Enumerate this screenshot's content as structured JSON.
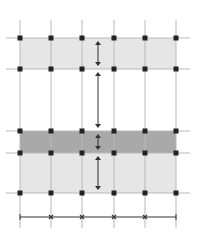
{
  "diagram": {
    "title": "",
    "colors": {
      "background": "#ffffff",
      "grid_line": "#b8b8b8",
      "light_band": "#e6e6e6",
      "dark_band": "#a9a9a9",
      "node": "#222222",
      "dimension": "#333333"
    },
    "columns": 6,
    "rows": 5,
    "bands": [
      {
        "name": "top-light-band",
        "shade": "light",
        "from_row": 0,
        "to_row": 1
      },
      {
        "name": "middle-dark-band",
        "shade": "dark",
        "from_row": 2,
        "to_row": 3
      },
      {
        "name": "bottom-light-band",
        "shade": "light",
        "from_row": 3,
        "to_row": 4
      }
    ],
    "vertical_dimension_segments": [
      {
        "name": "dim-top-band",
        "from_row": 0,
        "to_row": 1
      },
      {
        "name": "dim-gap",
        "from_row": 1,
        "to_row": 2
      },
      {
        "name": "dim-dark-band",
        "from_row": 2,
        "to_row": 3
      },
      {
        "name": "dim-bottom-band",
        "from_row": 3,
        "to_row": 4
      }
    ],
    "horizontal_dimension_spans": 5
  }
}
